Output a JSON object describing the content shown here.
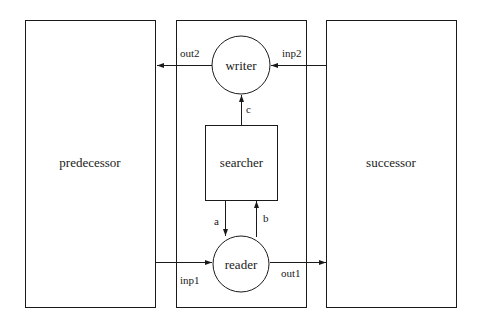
{
  "diagram": {
    "nodes": {
      "predecessor": {
        "label": "predecessor",
        "shape": "rect"
      },
      "container": {
        "label": "",
        "shape": "rect"
      },
      "successor": {
        "label": "successor",
        "shape": "rect"
      },
      "writer": {
        "label": "writer",
        "shape": "circle"
      },
      "searcher": {
        "label": "searcher",
        "shape": "rect"
      },
      "reader": {
        "label": "reader",
        "shape": "circle"
      }
    },
    "edges": {
      "out2": {
        "label": "out2",
        "from": "writer",
        "to": "predecessor"
      },
      "inp2": {
        "label": "inp2",
        "from": "successor",
        "to": "writer"
      },
      "c": {
        "label": "c",
        "from": "searcher",
        "to": "writer"
      },
      "a": {
        "label": "a",
        "from": "searcher",
        "to": "reader"
      },
      "b": {
        "label": "b",
        "from": "reader",
        "to": "searcher"
      },
      "inp1": {
        "label": "inp1",
        "from": "predecessor",
        "to": "reader"
      },
      "out1": {
        "label": "out1",
        "from": "reader",
        "to": "successor"
      }
    },
    "colors": {
      "stroke": "#1a1a1a",
      "background": "#ffffff"
    }
  }
}
